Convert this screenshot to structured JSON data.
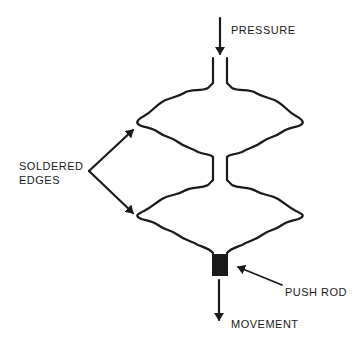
{
  "diagram": {
    "type": "bellows-capsule-schematic",
    "colors": {
      "line": "#1a1a1a",
      "background": "#ffffff"
    },
    "labels": {
      "pressure": "PRESSURE",
      "soldered_line1": "SOLDERED",
      "soldered_line2": "EDGES",
      "push_rod": "PUSH ROD",
      "movement": "MOVEMENT"
    },
    "components": [
      {
        "id": "input-tube",
        "desc": "inlet tube"
      },
      {
        "id": "upper-capsule",
        "desc": "upper corrugated diaphragm pair"
      },
      {
        "id": "neck",
        "desc": "connecting neck"
      },
      {
        "id": "lower-capsule",
        "desc": "lower corrugated diaphragm pair"
      },
      {
        "id": "push-rod",
        "desc": "push rod block"
      }
    ]
  }
}
